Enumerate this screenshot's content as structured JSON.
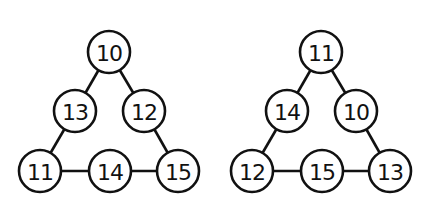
{
  "diagram": {
    "type": "number-triangles",
    "triangles": [
      {
        "name": "left-triangle",
        "nodes": [
          {
            "pos": "top",
            "value": "10",
            "cx": 109,
            "cy": 52
          },
          {
            "pos": "mid-left",
            "value": "13",
            "cx": 75,
            "cy": 111
          },
          {
            "pos": "mid-right",
            "value": "12",
            "cx": 144,
            "cy": 111
          },
          {
            "pos": "bottom-left",
            "value": "11",
            "cx": 40,
            "cy": 171
          },
          {
            "pos": "bottom-mid",
            "value": "14",
            "cx": 110,
            "cy": 171
          },
          {
            "pos": "bottom-right",
            "value": "15",
            "cx": 178,
            "cy": 171
          }
        ]
      },
      {
        "name": "right-triangle",
        "nodes": [
          {
            "pos": "top",
            "value": "11",
            "cx": 321,
            "cy": 52
          },
          {
            "pos": "mid-left",
            "value": "14",
            "cx": 287,
            "cy": 111
          },
          {
            "pos": "mid-right",
            "value": "10",
            "cx": 356,
            "cy": 111
          },
          {
            "pos": "bottom-left",
            "value": "12",
            "cx": 252,
            "cy": 171
          },
          {
            "pos": "bottom-mid",
            "value": "15",
            "cx": 322,
            "cy": 171
          },
          {
            "pos": "bottom-right",
            "value": "13",
            "cx": 390,
            "cy": 171
          }
        ]
      }
    ],
    "edges": [
      [
        "top",
        "mid-left"
      ],
      [
        "top",
        "mid-right"
      ],
      [
        "mid-left",
        "bottom-left"
      ],
      [
        "mid-right",
        "bottom-right"
      ],
      [
        "bottom-left",
        "bottom-mid"
      ],
      [
        "bottom-mid",
        "bottom-right"
      ]
    ],
    "node_radius": 21,
    "colors": {
      "stroke": "#111111",
      "fill": "#ffffff",
      "background": "#ffffff"
    }
  }
}
